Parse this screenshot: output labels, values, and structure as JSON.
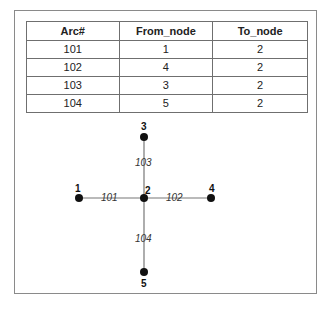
{
  "table": {
    "headers": [
      "Arc#",
      "From_node",
      "To_node"
    ],
    "rows": [
      [
        "101",
        "1",
        "2"
      ],
      [
        "102",
        "4",
        "2"
      ],
      [
        "103",
        "3",
        "2"
      ],
      [
        "104",
        "5",
        "2"
      ]
    ]
  },
  "graph": {
    "nodes": [
      {
        "id": "1",
        "x": 79,
        "y": 198
      },
      {
        "id": "2",
        "x": 144,
        "y": 198
      },
      {
        "id": "3",
        "x": 144,
        "y": 137
      },
      {
        "id": "4",
        "x": 211,
        "y": 198
      },
      {
        "id": "5",
        "x": 144,
        "y": 272
      }
    ],
    "arcs": [
      {
        "label": "101",
        "from": "1",
        "to": "2"
      },
      {
        "label": "102",
        "from": "4",
        "to": "2"
      },
      {
        "label": "103",
        "from": "3",
        "to": "2"
      },
      {
        "label": "104",
        "from": "5",
        "to": "2"
      }
    ],
    "colors": {
      "edge": "#777777",
      "node": "#111111"
    }
  }
}
